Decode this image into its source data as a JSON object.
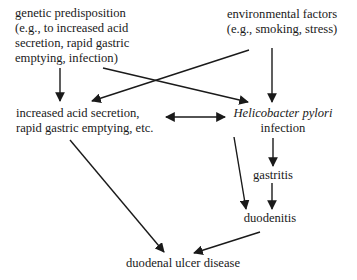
{
  "diagram": {
    "type": "causal-flow",
    "cutoff_header": "— — — — — —",
    "nodes": {
      "genetic": {
        "lines": [
          "genetic predisposition",
          "(e.g., to increased acid",
          "secretion, rapid gastric",
          "emptying, infection)"
        ]
      },
      "environmental": {
        "lines": [
          "environmental factors",
          "(e.g., smoking, stress)"
        ]
      },
      "increased_acid": {
        "lines": [
          "increased acid secretion,",
          "rapid gastric emptying, etc."
        ]
      },
      "h_pylori": {
        "organism": "Helicobacter pylori",
        "label": "infection"
      },
      "gastritis": {
        "label": "gastritis"
      },
      "duodenitis": {
        "label": "duodenitis"
      },
      "ulcer": {
        "label": "duodenal ulcer disease"
      }
    },
    "edges": [
      {
        "from": "genetic",
        "to": "increased_acid"
      },
      {
        "from": "genetic",
        "to": "h_pylori"
      },
      {
        "from": "environmental",
        "to": "increased_acid"
      },
      {
        "from": "environmental",
        "to": "h_pylori"
      },
      {
        "from": "increased_acid",
        "to": "h_pylori",
        "bidirectional": true
      },
      {
        "from": "h_pylori",
        "to": "gastritis"
      },
      {
        "from": "gastritis",
        "to": "duodenitis"
      },
      {
        "from": "h_pylori",
        "to": "duodenitis"
      },
      {
        "from": "increased_acid",
        "to": "ulcer"
      },
      {
        "from": "duodenitis",
        "to": "ulcer"
      }
    ],
    "colors": {
      "ink": "#1a1a1a",
      "background": "#ffffff"
    }
  }
}
